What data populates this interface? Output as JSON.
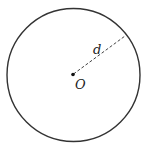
{
  "diagram": {
    "type": "circle",
    "center_label": "O",
    "segment_label": "d",
    "colors": {
      "stroke": "#333333",
      "dash": "#444444",
      "background": "#ffffff"
    }
  }
}
